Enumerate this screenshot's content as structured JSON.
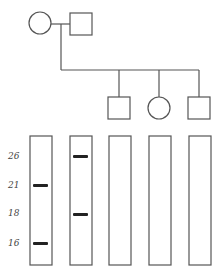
{
  "pedigree": {
    "parents": [
      {
        "sex": "female",
        "shape": "circle"
      },
      {
        "sex": "male",
        "shape": "square"
      }
    ],
    "children": [
      {
        "sex": "male",
        "shape": "square"
      },
      {
        "sex": "female",
        "shape": "circle"
      },
      {
        "sex": "male",
        "shape": "square"
      }
    ]
  },
  "gel": {
    "size_labels": [
      "26",
      "21",
      "18",
      "16"
    ],
    "lanes": [
      {
        "bands": [
          "21",
          "16"
        ]
      },
      {
        "bands": [
          "26",
          "18"
        ]
      },
      {
        "bands": []
      },
      {
        "bands": []
      },
      {
        "bands": []
      }
    ]
  },
  "colors": {
    "line": "#555555",
    "band": "#222222"
  }
}
